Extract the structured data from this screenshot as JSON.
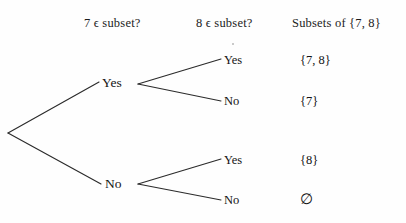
{
  "figure": {
    "background_color": "#fefefe",
    "line_color": "#2b2b2b"
  },
  "headers": [
    {
      "id": "hdr-1",
      "label": "7 ϵ subset?"
    },
    {
      "id": "hdr-2",
      "label": "8 ϵ subset?"
    },
    {
      "id": "hdr-3",
      "label": "Subsets of {7, 8}"
    }
  ],
  "tree": {
    "root": {
      "x": 8,
      "y": 133
    },
    "level1": [
      {
        "id": "node-yes",
        "label": "Yes",
        "x": 115,
        "y": 83
      },
      {
        "id": "node-no",
        "label": "No",
        "x": 115,
        "y": 184
      }
    ],
    "level2": [
      {
        "id": "leaf-yes-1",
        "label": "Yes",
        "parent": "node-yes",
        "x": 232,
        "y": 61
      },
      {
        "id": "leaf-no-1",
        "label": "No",
        "parent": "node-yes",
        "x": 232,
        "y": 102
      },
      {
        "id": "leaf-yes-2",
        "label": "Yes",
        "parent": "node-no",
        "x": 232,
        "y": 161
      },
      {
        "id": "leaf-no-2",
        "label": "No",
        "parent": "node-no",
        "x": 232,
        "y": 201
      }
    ]
  },
  "outcomes": [
    {
      "id": "out-1",
      "label": "{7, 8}",
      "path": "Yes-Yes"
    },
    {
      "id": "out-2",
      "label": "{7}",
      "path": "Yes-No"
    },
    {
      "id": "out-3",
      "label": "{8}",
      "path": "No-Yes"
    },
    {
      "id": "out-4",
      "label": "∅",
      "path": "No-No"
    }
  ]
}
